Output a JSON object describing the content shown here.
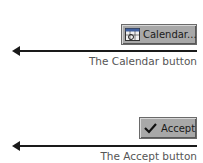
{
  "callouts": [
    {
      "button_label": "Calendar...",
      "icon": "calendar-icon",
      "caption": "The Calendar button"
    },
    {
      "button_label": "Accept",
      "icon": "checkmark-icon",
      "caption": "The Accept button"
    }
  ],
  "colors": {
    "button_bg": "#a8a8a8",
    "caption_text": "#555555",
    "arrow": "#1a1a1a"
  }
}
